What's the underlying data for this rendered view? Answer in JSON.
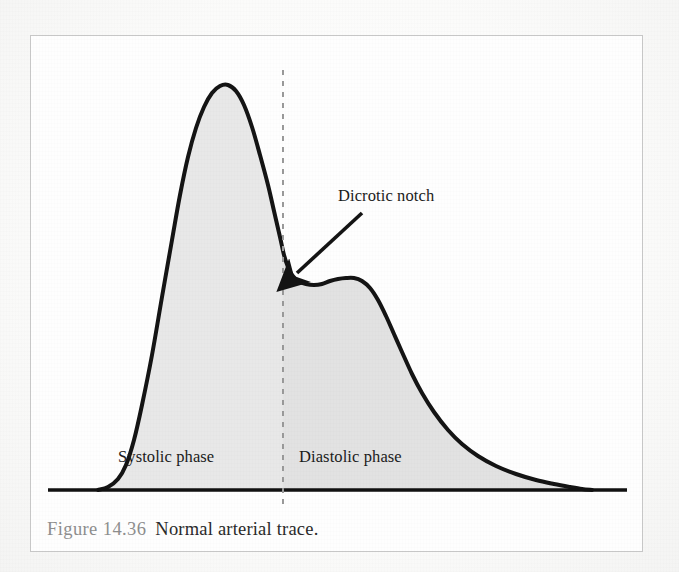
{
  "figure": {
    "caption_number": "Figure 14.36",
    "caption_text": "Normal arterial trace.",
    "caption_number_color": "#8e8e8e",
    "caption_text_color": "#2a2a2a",
    "border_color": "#c9c9c9",
    "background_color": "#fefefe"
  },
  "annotations": {
    "dicrotic_notch_label": "Dicrotic notch",
    "systolic_label": "Systolic phase",
    "diastolic_label": "Diastolic phase"
  },
  "chart_data": {
    "type": "area",
    "title": "Normal arterial trace",
    "subtitle": "Figure 14.36",
    "xlabel": "",
    "ylabel": "",
    "grid": false,
    "legend_position": "none",
    "axis_ranges": {
      "xlim": [
        0,
        613
      ],
      "ylim": [
        0,
        470
      ]
    },
    "curve_color": "#141414",
    "curve_width_px": 4,
    "fill_color_systolic": "#e8e8e8",
    "fill_color_diastolic": "#e2e2e2",
    "baseline_color": "#111111",
    "baseline_y_px": 455,
    "baseline_x_start_px": 18,
    "baseline_x_end_px": 597,
    "divider": {
      "label": "systolic/diastolic boundary",
      "x_px": 253,
      "y_top_px": 35,
      "y_bottom_px": 470,
      "color": "#9a9a9a",
      "style": "dashed"
    },
    "series": [
      {
        "name": "Arterial pressure waveform",
        "points_px": [
          [
            68,
            455
          ],
          [
            78,
            452
          ],
          [
            88,
            444
          ],
          [
            96,
            430
          ],
          [
            104,
            405
          ],
          [
            112,
            370
          ],
          [
            122,
            320
          ],
          [
            132,
            262
          ],
          [
            142,
            205
          ],
          [
            150,
            160
          ],
          [
            158,
            122
          ],
          [
            166,
            93
          ],
          [
            174,
            72
          ],
          [
            182,
            58
          ],
          [
            190,
            51
          ],
          [
            198,
            50
          ],
          [
            206,
            56
          ],
          [
            214,
            70
          ],
          [
            222,
            92
          ],
          [
            230,
            120
          ],
          [
            238,
            150
          ],
          [
            244,
            176
          ],
          [
            250,
            202
          ],
          [
            254,
            220
          ],
          [
            258,
            232
          ],
          [
            262,
            240
          ],
          [
            268,
            246
          ],
          [
            276,
            249
          ],
          [
            284,
            250
          ],
          [
            292,
            249
          ],
          [
            300,
            246
          ],
          [
            308,
            244
          ],
          [
            316,
            243
          ],
          [
            324,
            243
          ],
          [
            332,
            246
          ],
          [
            340,
            253
          ],
          [
            348,
            265
          ],
          [
            356,
            281
          ],
          [
            364,
            299
          ],
          [
            372,
            317
          ],
          [
            382,
            339
          ],
          [
            392,
            358
          ],
          [
            404,
            377
          ],
          [
            418,
            395
          ],
          [
            432,
            409
          ],
          [
            448,
            421
          ],
          [
            466,
            431
          ],
          [
            486,
            439
          ],
          [
            506,
            445
          ],
          [
            524,
            449
          ],
          [
            540,
            452
          ],
          [
            552,
            454
          ],
          [
            562,
            455
          ]
        ],
        "annotated_features": [
          {
            "name": "systolic_peak",
            "x_px": 195,
            "y_px": 50,
            "note": "Systolic peak"
          },
          {
            "name": "dicrotic_notch",
            "x_px": 284,
            "y_px": 250,
            "note": "Dicrotic notch"
          },
          {
            "name": "dicrotic_wave",
            "x_px": 322,
            "y_px": 243,
            "note": "Dicrotic wave / secondary hump"
          },
          {
            "name": "foot",
            "x_px": 68,
            "y_px": 455,
            "note": "Waveform upstroke foot"
          },
          {
            "name": "end_diastole",
            "x_px": 562,
            "y_px": 455,
            "note": "Return to baseline"
          }
        ]
      }
    ],
    "pointer": {
      "name": "dicrotic-notch-arrow",
      "from_px": [
        332,
        178
      ],
      "to_px": [
        267,
        238
      ],
      "color": "#141414"
    }
  }
}
